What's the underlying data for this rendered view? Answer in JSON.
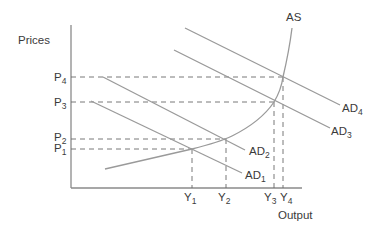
{
  "diagram": {
    "y_axis_label": "Prices",
    "x_axis_label": "Output",
    "supply_curve_label": "AS",
    "price_levels": [
      {
        "base": "P",
        "sub": "4"
      },
      {
        "base": "P",
        "sub": "3"
      },
      {
        "base": "P",
        "sub": "2"
      },
      {
        "base": "P",
        "sub": "1"
      }
    ],
    "output_levels": [
      {
        "base": "Y",
        "sub": "1"
      },
      {
        "base": "Y",
        "sub": "2"
      },
      {
        "base": "Y",
        "sub": "3"
      },
      {
        "base": "Y",
        "sub": "4"
      }
    ],
    "demand_curves": [
      {
        "base": "AD",
        "sub": "4"
      },
      {
        "base": "AD",
        "sub": "3"
      },
      {
        "base": "AD",
        "sub": "2"
      },
      {
        "base": "AD",
        "sub": "1"
      }
    ],
    "colors": {
      "line": "#9a9a9a",
      "axis": "#8a8a8a",
      "dash": "#6a6a6a",
      "text": "#3a3a3a"
    }
  }
}
